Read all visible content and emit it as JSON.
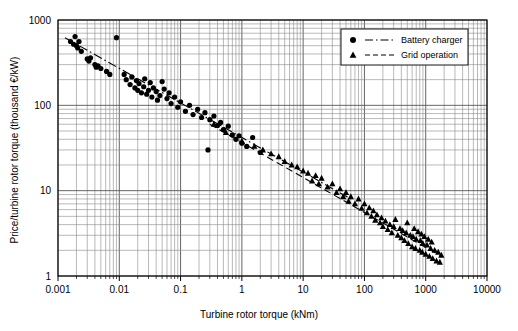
{
  "chart_data": {
    "type": "scatter",
    "title": "",
    "xlabel": "Turbine rotor torque (kNm)",
    "ylabel": "Price/turbine rotor torque (thousand €/kW)",
    "xscale": "log",
    "yscale": "log",
    "xlim": [
      0.001,
      10000
    ],
    "ylim": [
      1,
      1000
    ],
    "xticks": [
      "0.001",
      "0.01",
      "0.1",
      "1",
      "10",
      "100",
      "1000",
      "10000"
    ],
    "yticks": [
      "1",
      "10",
      "100",
      "1000"
    ],
    "grid": "log-minor-both",
    "legend_position": "top-right",
    "series": [
      {
        "name": "Battery charger",
        "marker": "circle",
        "line": "dash-dot",
        "color": "#000000",
        "points": [
          [
            0.0016,
            560
          ],
          [
            0.0018,
            520
          ],
          [
            0.0019,
            640
          ],
          [
            0.002,
            500
          ],
          [
            0.0021,
            470
          ],
          [
            0.0022,
            560
          ],
          [
            0.0024,
            430
          ],
          [
            0.003,
            350
          ],
          [
            0.0032,
            330
          ],
          [
            0.0034,
            360
          ],
          [
            0.004,
            300
          ],
          [
            0.0042,
            280
          ],
          [
            0.0045,
            290
          ],
          [
            0.005,
            270
          ],
          [
            0.0062,
            250
          ],
          [
            0.007,
            230
          ],
          [
            0.009,
            620
          ],
          [
            0.012,
            230
          ],
          [
            0.013,
            200
          ],
          [
            0.015,
            175
          ],
          [
            0.016,
            215
          ],
          [
            0.018,
            160
          ],
          [
            0.019,
            195
          ],
          [
            0.02,
            150
          ],
          [
            0.021,
            180
          ],
          [
            0.023,
            140
          ],
          [
            0.025,
            165
          ],
          [
            0.026,
            205
          ],
          [
            0.028,
            135
          ],
          [
            0.03,
            150
          ],
          [
            0.032,
            185
          ],
          [
            0.034,
            125
          ],
          [
            0.036,
            160
          ],
          [
            0.04,
            145
          ],
          [
            0.042,
            115
          ],
          [
            0.046,
            130
          ],
          [
            0.05,
            190
          ],
          [
            0.054,
            155
          ],
          [
            0.06,
            120
          ],
          [
            0.065,
            140
          ],
          [
            0.07,
            105
          ],
          [
            0.08,
            125
          ],
          [
            0.09,
            95
          ],
          [
            0.1,
            110
          ],
          [
            0.12,
            85
          ],
          [
            0.14,
            100
          ],
          [
            0.16,
            78
          ],
          [
            0.19,
            90
          ],
          [
            0.22,
            72
          ],
          [
            0.25,
            82
          ],
          [
            0.28,
            30
          ],
          [
            0.3,
            68
          ],
          [
            0.35,
            75
          ],
          [
            0.4,
            58
          ],
          [
            0.45,
            63
          ],
          [
            0.5,
            52
          ],
          [
            0.6,
            57
          ],
          [
            0.7,
            45
          ],
          [
            0.8,
            40
          ],
          [
            0.9,
            44
          ],
          [
            1.0,
            36
          ],
          [
            1.2,
            33
          ],
          [
            1.5,
            42
          ],
          [
            2.0,
            28
          ]
        ],
        "fit_line": {
          "x1": 0.0013,
          "y1": 620,
          "x2": 60,
          "y2": 8.0
        }
      },
      {
        "name": "Grid operation",
        "marker": "triangle",
        "line": "dashed",
        "color": "#000000",
        "points": [
          [
            0.35,
            60
          ],
          [
            0.55,
            48
          ],
          [
            1.0,
            38
          ],
          [
            1.6,
            33
          ],
          [
            2.2,
            30
          ],
          [
            3.0,
            27
          ],
          [
            4.0,
            25
          ],
          [
            5.0,
            22
          ],
          [
            6.5,
            20
          ],
          [
            8.0,
            19
          ],
          [
            10,
            17
          ],
          [
            12,
            16
          ],
          [
            14,
            13
          ],
          [
            16,
            15
          ],
          [
            18,
            12
          ],
          [
            20,
            14
          ],
          [
            25,
            11
          ],
          [
            30,
            12
          ],
          [
            35,
            9.5
          ],
          [
            40,
            10.5
          ],
          [
            45,
            8.5
          ],
          [
            50,
            9.5
          ],
          [
            55,
            7.5
          ],
          [
            60,
            8.5
          ],
          [
            70,
            7.0
          ],
          [
            80,
            8.0
          ],
          [
            90,
            6.2
          ],
          [
            100,
            7.0
          ],
          [
            110,
            5.5
          ],
          [
            120,
            6.3
          ],
          [
            130,
            5.0
          ],
          [
            140,
            5.8
          ],
          [
            150,
            4.5
          ],
          [
            160,
            5.2
          ],
          [
            180,
            4.2
          ],
          [
            190,
            4.8
          ],
          [
            200,
            3.8
          ],
          [
            220,
            4.4
          ],
          [
            240,
            3.5
          ],
          [
            260,
            4.0
          ],
          [
            280,
            3.2
          ],
          [
            300,
            3.8
          ],
          [
            320,
            4.6
          ],
          [
            350,
            3.0
          ],
          [
            380,
            3.6
          ],
          [
            400,
            2.8
          ],
          [
            420,
            3.4
          ],
          [
            450,
            2.6
          ],
          [
            480,
            3.2
          ],
          [
            500,
            4.2
          ],
          [
            520,
            2.4
          ],
          [
            560,
            3.0
          ],
          [
            600,
            2.2
          ],
          [
            620,
            2.9
          ],
          [
            650,
            3.6
          ],
          [
            680,
            2.1
          ],
          [
            700,
            2.7
          ],
          [
            750,
            3.3
          ],
          [
            800,
            2.0
          ],
          [
            820,
            2.6
          ],
          [
            850,
            3.1
          ],
          [
            880,
            1.9
          ],
          [
            900,
            2.4
          ],
          [
            950,
            2.9
          ],
          [
            1000,
            1.8
          ],
          [
            1050,
            2.3
          ],
          [
            1100,
            2.7
          ],
          [
            1150,
            1.7
          ],
          [
            1200,
            2.1
          ],
          [
            1250,
            2.5
          ],
          [
            1300,
            1.6
          ],
          [
            1400,
            2.0
          ],
          [
            1500,
            1.5
          ],
          [
            1600,
            1.9
          ],
          [
            1700,
            1.45
          ],
          [
            1800,
            1.75
          ]
        ],
        "fit_line": {
          "x1": 0.3,
          "y1": 60,
          "x2": 1800,
          "y2": 1.7
        }
      }
    ]
  },
  "axes": {
    "x": {
      "label": "Turbine rotor torque (kNm)",
      "ticks": [
        "0.001",
        "0.01",
        "0.1",
        "1",
        "10",
        "100",
        "1000",
        "10000"
      ]
    },
    "y": {
      "label": "Price/turbine rotor torque (thousand €/kW)",
      "ticks": [
        "1",
        "10",
        "100",
        "1000"
      ]
    }
  },
  "legend": {
    "items": [
      {
        "label": "Battery charger",
        "marker": "circle",
        "line": "dash-dot"
      },
      {
        "label": "Grid operation",
        "marker": "triangle",
        "line": "dashed"
      }
    ]
  }
}
